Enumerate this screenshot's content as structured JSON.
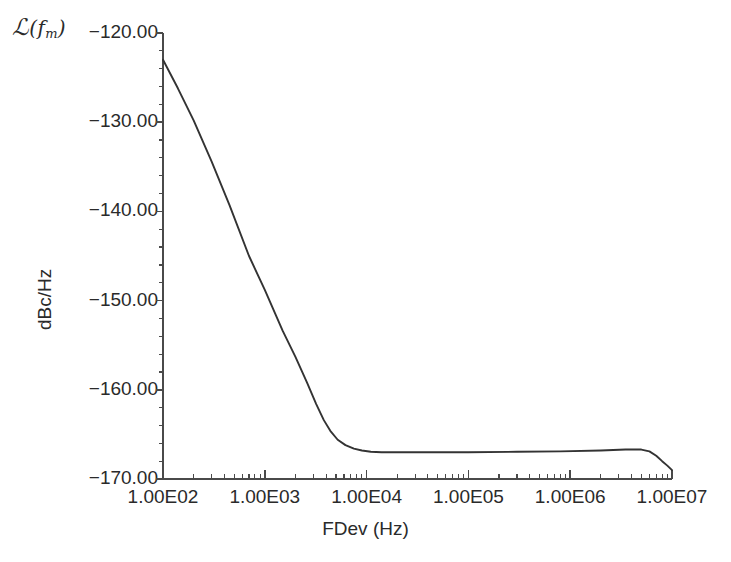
{
  "figure": {
    "corner_symbol_script": "ℒ",
    "corner_symbol_open": "(",
    "corner_symbol_var": "f",
    "corner_symbol_sub": "m",
    "corner_symbol_close": ")",
    "background_color": "#ffffff",
    "line_color": "#333333",
    "axis_color": "#4a4a4a",
    "text_color": "#2a2a2a"
  },
  "chart_data": {
    "type": "line",
    "title": "",
    "subtitle": "",
    "xlabel": "FDev (Hz)",
    "ylabel": "dBc/Hz",
    "xscale": "log",
    "yscale": "linear",
    "xlim": [
      100,
      10000000
    ],
    "ylim": [
      -170,
      -120
    ],
    "grid": false,
    "legend": null,
    "xtick_labels": [
      "1.00E02",
      "1.00E03",
      "1.00E04",
      "1.00E05",
      "1.00E06",
      "1.00E07"
    ],
    "xtick_values": [
      100,
      1000,
      10000,
      100000,
      1000000,
      10000000
    ],
    "ytick_labels": [
      "-120.00",
      "-130.00",
      "-140.00",
      "-150.00",
      "-160.00",
      "-170.00"
    ],
    "ytick_values": [
      -120,
      -130,
      -140,
      -150,
      -160,
      -170
    ],
    "y_minor_step": 2,
    "series": [
      {
        "name": "phase noise",
        "x": [
          100,
          140,
          200,
          300,
          450,
          700,
          1000,
          1500,
          2000,
          2600,
          3200,
          3800,
          4400,
          5200,
          6200,
          7500,
          9000,
          11000,
          14000,
          20000,
          40000,
          100000,
          300000,
          800000,
          2000000,
          3500000,
          5000000,
          6000000,
          7000000,
          8000000,
          9000000,
          10000000
        ],
        "y": [
          -123.0,
          -126.2,
          -129.8,
          -134.4,
          -139.3,
          -145.0,
          -148.8,
          -153.4,
          -156.3,
          -159.2,
          -161.6,
          -163.4,
          -164.6,
          -165.6,
          -166.2,
          -166.6,
          -166.8,
          -166.95,
          -167.0,
          -167.0,
          -167.0,
          -167.0,
          -166.95,
          -166.9,
          -166.8,
          -166.7,
          -166.7,
          -166.9,
          -167.4,
          -168.0,
          -168.5,
          -169.0
        ]
      }
    ],
    "annotations": []
  },
  "plot_geometry": {
    "left_px": 163,
    "right_px": 672,
    "top_px": 33,
    "bottom_px": 479
  }
}
